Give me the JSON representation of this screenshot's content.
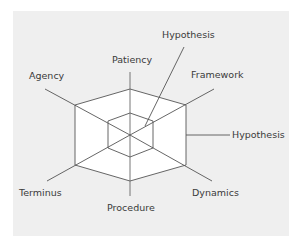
{
  "diagram": {
    "type": "hexagonal radar/spider web diagram",
    "background_color": "#efefef",
    "line_color": "#555555",
    "fill_color": "#ffffff",
    "labels": {
      "hypothesis_top": "Hypothesis",
      "patiency": "Patiency",
      "framework": "Framework",
      "agency": "Agency",
      "hypothesis_right": "Hypothesis",
      "terminus": "Terminus",
      "dynamics": "Dynamics",
      "procedure": "Procedure"
    }
  }
}
